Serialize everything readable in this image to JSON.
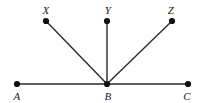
{
  "figure": {
    "type": "geometry-diagram",
    "background_color": "#ffffff",
    "stroke_color": "#2b2b2b",
    "point_color": "#111111",
    "label_color": "#1a1a1a",
    "stroke_width": 1.4,
    "point_radius": 3.1,
    "canvas": {
      "width": 197,
      "height": 103
    },
    "points": [
      {
        "id": "X",
        "label": "X",
        "x": 46,
        "y": 21,
        "label_x": 46,
        "label_y": 10
      },
      {
        "id": "Y",
        "label": "Y",
        "x": 107,
        "y": 21,
        "label_x": 108,
        "label_y": 10
      },
      {
        "id": "Z",
        "label": "Z",
        "x": 172,
        "y": 21,
        "label_x": 171,
        "label_y": 10
      },
      {
        "id": "A",
        "label": "A",
        "x": 17,
        "y": 84,
        "label_x": 17,
        "label_y": 96
      },
      {
        "id": "B",
        "label": "B",
        "x": 107,
        "y": 84,
        "label_x": 108,
        "label_y": 96
      },
      {
        "id": "C",
        "label": "C",
        "x": 188,
        "y": 84,
        "label_x": 187,
        "label_y": 96
      }
    ],
    "segments": [
      {
        "id": "AC",
        "from": "A",
        "to": "C",
        "x1": 17,
        "y1": 84,
        "x2": 188,
        "y2": 84
      },
      {
        "id": "BX",
        "from": "B",
        "to": "X",
        "x1": 107,
        "y1": 84,
        "x2": 46,
        "y2": 21
      },
      {
        "id": "BY",
        "from": "B",
        "to": "Y",
        "x1": 107,
        "y1": 84,
        "x2": 107,
        "y2": 21
      },
      {
        "id": "BZ",
        "from": "B",
        "to": "Z",
        "x1": 107,
        "y1": 84,
        "x2": 172,
        "y2": 21
      }
    ]
  }
}
